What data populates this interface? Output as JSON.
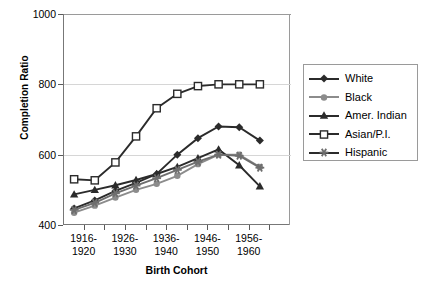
{
  "chart_data": {
    "type": "line",
    "title": "",
    "xlabel": "Birth Cohort",
    "ylabel": "Completion Ratio",
    "ylim": [
      400,
      1000
    ],
    "yticks": [
      400,
      600,
      800,
      1000
    ],
    "grid": true,
    "legend_position": "right",
    "categories": [
      "1916-1920",
      "1921-1925",
      "1926-1930",
      "1931-1935",
      "1936-1940",
      "1941-1945",
      "1946-1950",
      "1951-1955",
      "1956-1960",
      "1961-1965"
    ],
    "xtick_labels": [
      {
        "line1": "1916-",
        "line2": "1920"
      },
      {
        "line1": "1926-",
        "line2": "1930"
      },
      {
        "line1": "1936-",
        "line2": "1940"
      },
      {
        "line1": "1946-",
        "line2": "1950"
      },
      {
        "line1": "1956-",
        "line2": "1960"
      }
    ],
    "series": [
      {
        "name": "White",
        "marker": "diamond",
        "color": "#2b2b2b",
        "values": [
          447,
          470,
          497,
          520,
          545,
          600,
          647,
          680,
          678,
          640
        ]
      },
      {
        "name": "Black",
        "marker": "circle",
        "color": "#8c8c8c",
        "values": [
          435,
          455,
          478,
          500,
          517,
          540,
          573,
          600,
          600,
          565
        ]
      },
      {
        "name": "Amer. Indian",
        "marker": "triangle",
        "color": "#2b2b2b",
        "values": [
          487,
          500,
          513,
          528,
          545,
          565,
          590,
          615,
          570,
          510
        ]
      },
      {
        "name": "Asian/P.I.",
        "marker": "square",
        "color": "#2b2b2b",
        "values": [
          530,
          527,
          578,
          652,
          732,
          773,
          795,
          800,
          800,
          800
        ]
      },
      {
        "name": "Hispanic",
        "marker": "star",
        "color": "#6e6e6e",
        "values": [
          443,
          463,
          490,
          512,
          533,
          557,
          580,
          600,
          597,
          563
        ]
      }
    ]
  },
  "legend": {
    "entries": [
      {
        "label": "White"
      },
      {
        "label": "Black"
      },
      {
        "label": "Amer. Indian"
      },
      {
        "label": "Asian/P.I."
      },
      {
        "label": "Hispanic"
      }
    ]
  }
}
